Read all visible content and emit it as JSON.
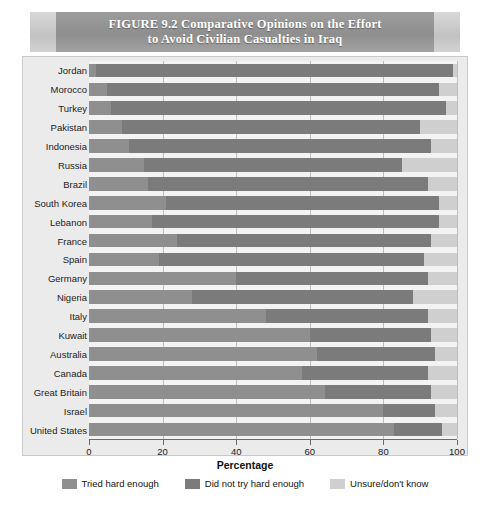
{
  "figure": {
    "label": "FIGURE 9.2",
    "title_line1": "FIGURE 9.2    Comparative Opinions on the Effort",
    "title_line2": "to Avoid Civilian Casualties in Iraq"
  },
  "chart_data": {
    "type": "bar",
    "orientation": "horizontal",
    "stacked": true,
    "title": "FIGURE 9.2 Comparative Opinions on the Effort to Avoid Civilian Casualties in Iraq",
    "xlabel": "Percentage",
    "ylabel": "",
    "xlim": [
      0,
      100
    ],
    "xticks": [
      0,
      20,
      40,
      60,
      80,
      100
    ],
    "grid": true,
    "legend_position": "bottom",
    "categories": [
      "Jordan",
      "Morocco",
      "Turkey",
      "Pakistan",
      "Indonesia",
      "Russia",
      "Brazil",
      "South Korea",
      "Lebanon",
      "France",
      "Spain",
      "Germany",
      "Nigeria",
      "Italy",
      "Kuwait",
      "Australia",
      "Canada",
      "Great Britain",
      "Israel",
      "United States"
    ],
    "series": [
      {
        "name": "Tried hard enough",
        "color": "#8f8f8f",
        "values": [
          2,
          5,
          6,
          9,
          11,
          15,
          16,
          21,
          17,
          24,
          19,
          40,
          28,
          48,
          60,
          62,
          58,
          64,
          80,
          83
        ]
      },
      {
        "name": "Did not try hard enough",
        "color": "#7b7b7b",
        "values": [
          97,
          90,
          91,
          81,
          82,
          70,
          76,
          74,
          78,
          69,
          72,
          52,
          60,
          44,
          33,
          32,
          34,
          29,
          14,
          13
        ]
      },
      {
        "name": "Unsure/don't know",
        "color": "#cfcfcf",
        "values": [
          1,
          5,
          3,
          10,
          7,
          15,
          8,
          5,
          5,
          7,
          9,
          8,
          12,
          8,
          7,
          6,
          8,
          7,
          6,
          4
        ]
      }
    ]
  },
  "legend": [
    {
      "label": "Tried hard enough",
      "color": "#8f8f8f",
      "icon": "legend-swatch"
    },
    {
      "label": "Did not try hard enough",
      "color": "#7b7b7b",
      "icon": "legend-swatch"
    },
    {
      "label": "Unsure/don't know",
      "color": "#cfcfcf",
      "icon": "legend-swatch"
    }
  ],
  "axis": {
    "x_title": "Percentage",
    "x_tick_labels": [
      "0",
      "20",
      "40",
      "60",
      "80",
      "100"
    ]
  }
}
